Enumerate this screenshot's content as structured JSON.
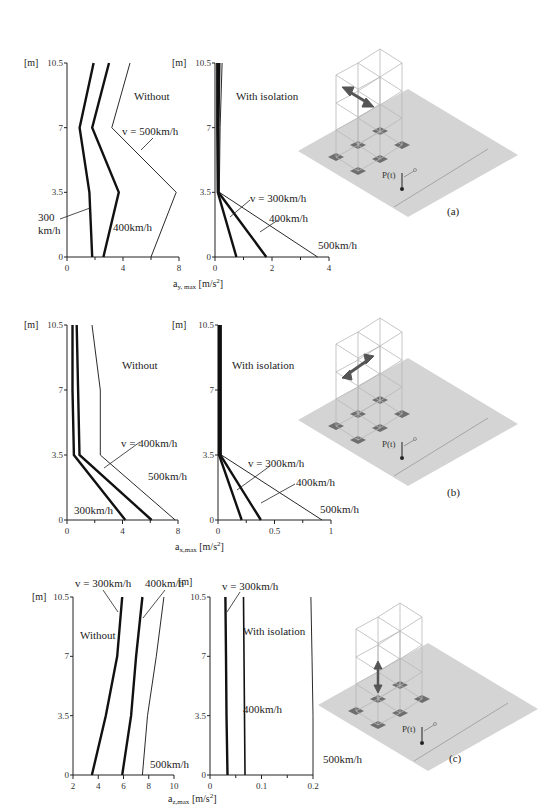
{
  "chart_data": [
    {
      "id": "a-without",
      "type": "line",
      "panel": "a",
      "title": "Without",
      "ylabel": "[m]",
      "xlabel": "",
      "y_ticks": [
        "0",
        "3.5",
        "7",
        "10.5"
      ],
      "x_ticks": [
        "0",
        "4",
        "8"
      ],
      "xlim": [
        0,
        8
      ],
      "ylim": [
        0,
        10.5
      ],
      "y": [
        0,
        3.5,
        7,
        10.5
      ],
      "series": [
        {
          "name": "300 km/h",
          "values": [
            1.8,
            1.6,
            0.9,
            1.9
          ],
          "weight": "bold"
        },
        {
          "name": "400km/h",
          "values": [
            2.6,
            3.7,
            1.8,
            3.0
          ],
          "weight": "bold"
        },
        {
          "name": "v = 500km/h",
          "values": [
            6.0,
            7.8,
            3.2,
            4.5
          ],
          "weight": "thin"
        }
      ],
      "annotations": [
        "v = 500km/h",
        "300",
        "km/h",
        "400km/h"
      ]
    },
    {
      "id": "a-with",
      "type": "line",
      "panel": "a",
      "title": "With isolation",
      "ylabel": "[m]",
      "xlabel": "a_y,max [m/s²]",
      "y_ticks": [
        "0",
        "3.5",
        "7",
        "10.5"
      ],
      "x_ticks": [
        "0",
        "2",
        "4"
      ],
      "xlim": [
        0,
        4
      ],
      "ylim": [
        0,
        10.5
      ],
      "y": [
        0,
        3.5,
        7,
        10.5
      ],
      "series": [
        {
          "name": "v = 300km/h",
          "values": [
            0.75,
            0.1,
            0.08,
            0.08
          ],
          "weight": "bold"
        },
        {
          "name": "400km/h",
          "values": [
            1.8,
            0.12,
            0.12,
            0.15
          ],
          "weight": "bold"
        },
        {
          "name": "500km/h",
          "values": [
            3.6,
            0.15,
            0.18,
            0.25
          ],
          "weight": "thin"
        }
      ],
      "annotations": [
        "v = 300km/h",
        "400km/h",
        "500km/h"
      ]
    },
    {
      "id": "b-without",
      "type": "line",
      "panel": "b",
      "title": "Without",
      "ylabel": "[m]",
      "xlabel": "",
      "y_ticks": [
        "0",
        "3.5",
        "7",
        "10.5"
      ],
      "x_ticks": [
        "0",
        "4",
        "8"
      ],
      "xlim": [
        0,
        8
      ],
      "ylim": [
        0,
        10.5
      ],
      "y": [
        0,
        3.5,
        7,
        10.5
      ],
      "series": [
        {
          "name": "300km/h",
          "values": [
            4.2,
            0.5,
            0.4,
            0.4
          ],
          "weight": "bold"
        },
        {
          "name": "v = 400km/h",
          "values": [
            6.1,
            0.9,
            0.8,
            0.7
          ],
          "weight": "bold"
        },
        {
          "name": "500km/h",
          "values": [
            7.8,
            2.4,
            2.4,
            1.8
          ],
          "weight": "thin"
        }
      ],
      "annotations": [
        "v = 400km/h",
        "500km/h",
        "300km/h"
      ]
    },
    {
      "id": "b-with",
      "type": "line",
      "panel": "b",
      "title": "With isolation",
      "ylabel": "[m]",
      "xlabel": "a_x,max [m/s²]",
      "y_ticks": [
        "0",
        "3.5",
        "7",
        "10.5"
      ],
      "x_ticks": [
        "0",
        "0.5",
        "1"
      ],
      "xlim": [
        0,
        1
      ],
      "ylim": [
        0,
        10.5
      ],
      "y": [
        0,
        3.5,
        7,
        10.5
      ],
      "series": [
        {
          "name": "v = 300km/h",
          "values": [
            0.21,
            0.01,
            0.01,
            0.01
          ],
          "weight": "bold"
        },
        {
          "name": "400km/h",
          "values": [
            0.38,
            0.02,
            0.02,
            0.02
          ],
          "weight": "bold"
        },
        {
          "name": "500km/h",
          "values": [
            0.92,
            0.03,
            0.03,
            0.03
          ],
          "weight": "thin"
        }
      ],
      "annotations": [
        "v = 300km/h",
        "400km/h",
        "500km/h"
      ]
    },
    {
      "id": "c-without",
      "type": "line",
      "panel": "c",
      "title": "Without",
      "ylabel": "[m]",
      "xlabel": "",
      "y_ticks": [
        "0",
        "3.5",
        "7",
        "10.5"
      ],
      "x_ticks": [
        "2",
        "4",
        "6",
        "8",
        "10"
      ],
      "xlim": [
        2,
        10
      ],
      "ylim": [
        0,
        10.5
      ],
      "y": [
        0,
        3.5,
        7,
        10.5
      ],
      "series": [
        {
          "name": "v = 300km/h",
          "values": [
            3.5,
            4.6,
            5.5,
            5.9
          ],
          "weight": "bold"
        },
        {
          "name": "400km/h",
          "values": [
            5.9,
            6.6,
            7.0,
            7.5
          ],
          "weight": "bold"
        },
        {
          "name": "500km/h",
          "values": [
            7.5,
            7.9,
            8.6,
            9.2
          ],
          "weight": "thin"
        }
      ],
      "annotations": [
        "v = 300km/h",
        "400km/h",
        "500km/h"
      ]
    },
    {
      "id": "c-with",
      "type": "line",
      "panel": "c",
      "title": "With isolation",
      "ylabel": "[m]",
      "xlabel": "a_z,max [m/s²]",
      "y_ticks": [
        "0",
        "3.5",
        "7",
        "10.5"
      ],
      "x_ticks": [
        "0",
        "0.1",
        "0.2"
      ],
      "xlim": [
        0,
        0.2
      ],
      "ylim": [
        0,
        10.5
      ],
      "y": [
        0,
        3.5,
        7,
        10.5
      ],
      "series": [
        {
          "name": "v = 300km/h",
          "values": [
            0.034,
            0.032,
            0.031,
            0.03
          ],
          "weight": "bold"
        },
        {
          "name": "400km/h",
          "values": [
            0.068,
            0.067,
            0.066,
            0.065
          ],
          "weight": "medium"
        },
        {
          "name": "500km/h",
          "values": [
            0.2,
            0.2,
            0.198,
            0.196
          ],
          "weight": "thin"
        }
      ],
      "annotations": [
        "v = 300km/h",
        "400km/h",
        "500km/h"
      ]
    }
  ],
  "labels": {
    "unit_m": "[m]",
    "without": "Without",
    "with_isolation": "With isolation",
    "xlabel_a_base": "a",
    "xlabel_a_sub": "y, max",
    "xlabel_a_unit": "[m/s",
    "xlabel_b_sub": "x,max",
    "xlabel_c_sub": "z,max",
    "sup2": "2",
    "close": "]",
    "panel_a": "(a)",
    "panel_b": "(b)",
    "panel_c": "(c)",
    "force": "P(t)",
    "a_v500": "v = 500km/h",
    "a_300": "300",
    "a_kmh": "km/h",
    "a_400": "400km/h",
    "a2_v300": "v = 300km/h",
    "a2_400": "400km/h",
    "a2_500": "500km/h",
    "b_v400": "v = 400km/h",
    "b_500": "500km/h",
    "b_300": "300km/h",
    "b2_v300": "v = 300km/h",
    "b2_400": "400km/h",
    "b2_500": "500km/h",
    "c_v300": "v = 300km/h",
    "c_400": "400km/h",
    "c_500": "500km/h",
    "c2_v300": "v = 300km/h",
    "c2_400": "400km/h",
    "c2_500": "500km/h"
  },
  "colors": {
    "ground": "#d4d4d4",
    "pad": "#6e6e6e",
    "frame": "#b8b8b8",
    "arrow": "#555555"
  }
}
